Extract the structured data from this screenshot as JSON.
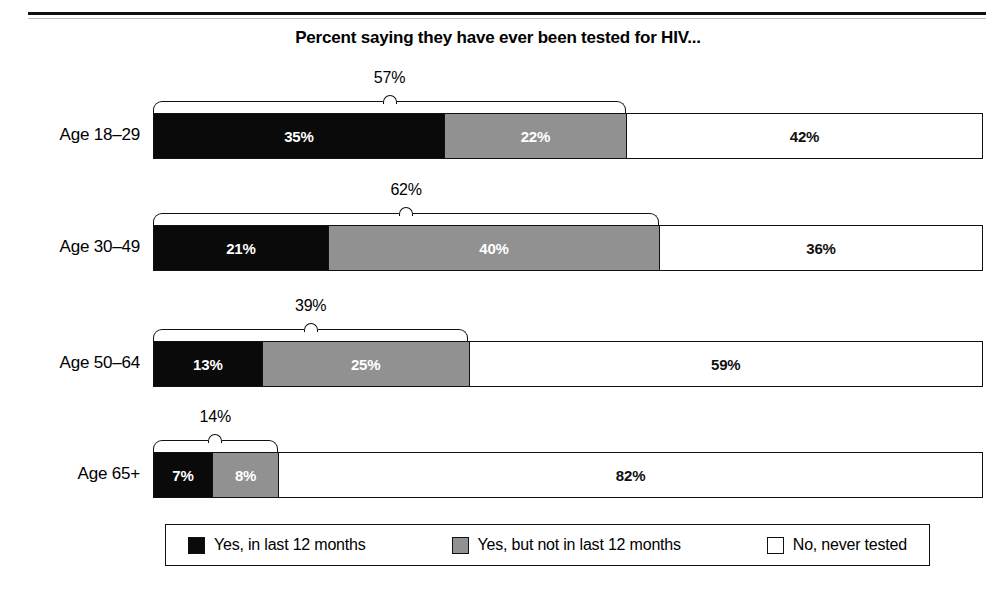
{
  "chart_data": {
    "type": "bar",
    "orientation": "horizontal",
    "stacked": true,
    "title": "Percent saying they have ever been tested for HIV...",
    "xlabel": "",
    "ylabel": "",
    "xlim": [
      0,
      100
    ],
    "grid": false,
    "legend_position": "bottom",
    "categories": [
      "Age 18–29",
      "Age 30–49",
      "Age 50–64",
      "Age 65+"
    ],
    "series": [
      {
        "name": "Yes, in last 12 months",
        "color": "#0a0a0a",
        "values": [
          35,
          21,
          13,
          7
        ]
      },
      {
        "name": "Yes, but not in last 12 months",
        "color": "#919191",
        "values": [
          22,
          40,
          25,
          8
        ]
      },
      {
        "name": "No, never tested",
        "color": "#ffffff",
        "values": [
          42,
          36,
          59,
          82
        ]
      }
    ],
    "value_labels": [
      [
        "35%",
        "22%",
        "42%"
      ],
      [
        "21%",
        "40%",
        "36%"
      ],
      [
        "13%",
        "25%",
        "59%"
      ],
      [
        "7%",
        "8%",
        "82%"
      ]
    ],
    "annotations": [
      {
        "category": "Age 18–29",
        "label": "57%",
        "value": 57,
        "span": [
          0,
          57
        ],
        "type": "bracket"
      },
      {
        "category": "Age 30–49",
        "label": "62%",
        "value": 62,
        "span": [
          0,
          61
        ],
        "type": "bracket"
      },
      {
        "category": "Age 50–64",
        "label": "39%",
        "value": 39,
        "span": [
          0,
          38
        ],
        "type": "bracket"
      },
      {
        "category": "Age 65+",
        "label": "14%",
        "value": 14,
        "span": [
          0,
          15
        ],
        "type": "bracket"
      }
    ]
  },
  "rows": [
    {
      "label": "Age 18–29",
      "bracket_label": "57%",
      "segments": [
        {
          "label": "35%",
          "pct": 35,
          "style": "s0"
        },
        {
          "label": "22%",
          "pct": 22,
          "style": "s1"
        },
        {
          "label": "42%",
          "pct": 43,
          "style": "s2"
        }
      ]
    },
    {
      "label": "Age 30–49",
      "bracket_label": "62%",
      "segments": [
        {
          "label": "21%",
          "pct": 21,
          "style": "s0"
        },
        {
          "label": "40%",
          "pct": 40,
          "style": "s1"
        },
        {
          "label": "36%",
          "pct": 39,
          "style": "s2"
        }
      ]
    },
    {
      "label": "Age 50–64",
      "bracket_label": "39%",
      "segments": [
        {
          "label": "13%",
          "pct": 13,
          "style": "s0"
        },
        {
          "label": "25%",
          "pct": 25,
          "style": "s1"
        },
        {
          "label": "59%",
          "pct": 62,
          "style": "s2"
        }
      ]
    },
    {
      "label": "Age 65+",
      "bracket_label": "14%",
      "segments": [
        {
          "label": "7%",
          "pct": 7,
          "style": "s0"
        },
        {
          "label": "8%",
          "pct": 8,
          "style": "s1"
        },
        {
          "label": "82%",
          "pct": 85,
          "style": "s2"
        }
      ]
    }
  ],
  "legend": {
    "items": [
      {
        "label": "Yes, in last 12 months",
        "color": "#0a0a0a"
      },
      {
        "label": "Yes, but not in last 12 months",
        "color": "#919191"
      },
      {
        "label": "No, never tested",
        "color": "#ffffff"
      }
    ]
  }
}
